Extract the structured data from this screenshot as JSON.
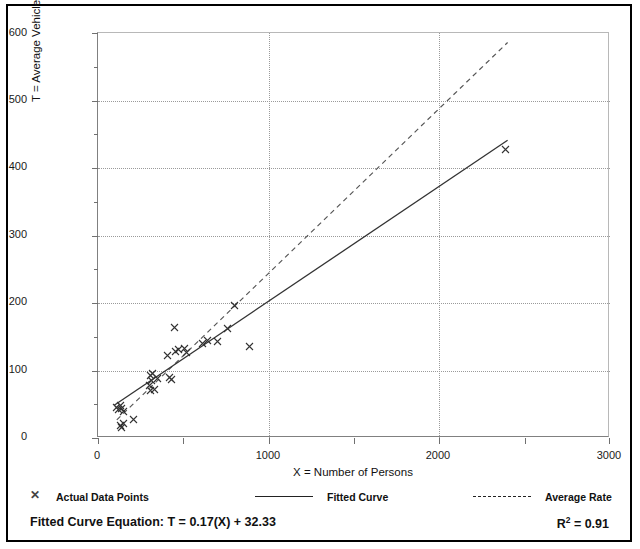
{
  "chart_data": {
    "type": "scatter",
    "title": "",
    "xlabel": "X = Number of Persons",
    "ylabel": "T = Average Vehicle Trip Ends",
    "xlim": [
      0,
      3000
    ],
    "ylim": [
      0,
      600
    ],
    "xticks": [
      0,
      1000,
      2000,
      3000
    ],
    "yticks": [
      0,
      100,
      200,
      300,
      400,
      500,
      600
    ],
    "xtick_labels": [
      "0",
      "1000",
      "2000",
      "3000"
    ],
    "ytick_labels": [
      "0",
      "100",
      "200",
      "300",
      "400",
      "500",
      "600"
    ],
    "grid": "dotted gridlines on both axes at major ticks",
    "legend_position": "below-plot",
    "series": [
      {
        "name": "Actual Data Points",
        "type": "scatter",
        "marker": "x",
        "color": "#333333",
        "points": [
          [
            110,
            45
          ],
          [
            120,
            42
          ],
          [
            130,
            48
          ],
          [
            140,
            44
          ],
          [
            150,
            40
          ],
          [
            130,
            18
          ],
          [
            140,
            15
          ],
          [
            150,
            22
          ],
          [
            210,
            27
          ],
          [
            300,
            78
          ],
          [
            305,
            70
          ],
          [
            310,
            92
          ],
          [
            315,
            85
          ],
          [
            320,
            96
          ],
          [
            330,
            72
          ],
          [
            350,
            88
          ],
          [
            410,
            122
          ],
          [
            420,
            90
          ],
          [
            430,
            86
          ],
          [
            450,
            163
          ],
          [
            455,
            128
          ],
          [
            470,
            131
          ],
          [
            505,
            132
          ],
          [
            520,
            127
          ],
          [
            610,
            140
          ],
          [
            640,
            145
          ],
          [
            700,
            143
          ],
          [
            760,
            162
          ],
          [
            800,
            196
          ],
          [
            890,
            135
          ],
          [
            2390,
            427
          ]
        ]
      },
      {
        "name": "Fitted Curve",
        "type": "line",
        "style": "solid",
        "color": "#333333",
        "equation": "T = 0.17(X) + 32.33",
        "slope": 0.17,
        "intercept": 32.33,
        "x_range": [
          95,
          2400
        ]
      },
      {
        "name": "Average Rate",
        "type": "line",
        "style": "dashed",
        "color": "#555555",
        "slope": 0.244,
        "intercept": 0,
        "x_range": [
          110,
          2400
        ]
      }
    ],
    "annotations": {
      "equation_label": "Fitted Curve Equation:",
      "equation_value": "T = 0.17(X) + 32.33",
      "r_squared_label": "R",
      "r_squared_sup": "2",
      "r_squared_value": "= 0.91",
      "r_squared_full": "R2 = 0.91"
    }
  },
  "legend": {
    "items": [
      {
        "label": "Actual Data Points",
        "marker": "x-marker-icon"
      },
      {
        "label": "Fitted Curve",
        "marker": "solid-line-icon"
      },
      {
        "label": "Average Rate",
        "marker": "dashed-line-icon"
      }
    ]
  },
  "footer": {
    "equation_text": "Fitted Curve Equation:  T = 0.17(X) + 32.33",
    "r2_prefix": "R",
    "r2_sup": "2",
    "r2_suffix": " = 0.91"
  },
  "colors": {
    "frame": "#000000",
    "grid": "#9a9a9a",
    "axis": "#808080",
    "data": "#333333",
    "text": "#111111"
  }
}
